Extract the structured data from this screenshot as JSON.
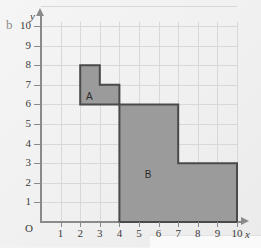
{
  "part_label": "b",
  "colors": {
    "background": "#f3f3f3",
    "grid_line": "#d8d8d8",
    "axis": "#8a8a8a",
    "shape_fill": "#9b9b9b",
    "shape_stroke": "#4a4a4a",
    "text": "#3b3b3b"
  },
  "axes": {
    "x_label": "x",
    "y_label": "y",
    "origin_label": "O",
    "x_ticks": [
      "1",
      "2",
      "3",
      "4",
      "5",
      "6",
      "7",
      "8",
      "9",
      "10"
    ],
    "y_ticks": [
      "10",
      "9",
      "8",
      "7",
      "6",
      "5",
      "4",
      "3",
      "2",
      "1"
    ]
  },
  "chart_data": {
    "type": "scatter",
    "title": "",
    "xlabel": "x",
    "ylabel": "y",
    "xlim": [
      0,
      10
    ],
    "ylim": [
      0,
      11
    ],
    "grid": true,
    "legend": "none",
    "x_ticks": [
      1,
      2,
      3,
      4,
      5,
      6,
      7,
      8,
      9,
      10
    ],
    "y_ticks": [
      1,
      2,
      3,
      4,
      5,
      6,
      7,
      8,
      9,
      10
    ],
    "shapes": [
      {
        "name": "A",
        "label": "A",
        "label_position": [
          2.5,
          6.4
        ],
        "vertices": [
          [
            2,
            6
          ],
          [
            2,
            8
          ],
          [
            3,
            8
          ],
          [
            3,
            7
          ],
          [
            4,
            7
          ],
          [
            4,
            6
          ]
        ],
        "area_squares": 3,
        "fill": "#9b9b9b",
        "stroke": "#4a4a4a"
      },
      {
        "name": "B",
        "label": "B",
        "label_position": [
          5.5,
          2.4
        ],
        "vertices": [
          [
            4,
            0
          ],
          [
            4,
            6
          ],
          [
            7,
            6
          ],
          [
            7,
            3
          ],
          [
            10,
            3
          ],
          [
            10,
            0
          ]
        ],
        "area_squares": 27,
        "fill": "#9b9b9b",
        "stroke": "#4a4a4a"
      }
    ]
  }
}
